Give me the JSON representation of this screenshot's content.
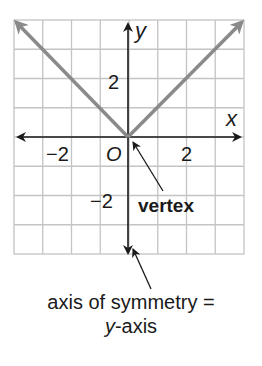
{
  "diagram": {
    "grid": {
      "x_min": -4,
      "x_max": 4,
      "y_min": -4,
      "y_max": 4,
      "cell": 1
    },
    "axes": {
      "x_label": "x",
      "y_label": "y",
      "origin_label": "O"
    },
    "ticks": {
      "x_neg": "−2",
      "x_pos": "2",
      "y_pos": "2",
      "y_neg": "−2"
    },
    "function": {
      "expression": "y = |x|",
      "color": "#8a8a8a"
    },
    "annotations": {
      "vertex": "vertex",
      "axis_line1": "axis of symmetry =",
      "axis_line2_italic": "y",
      "axis_line2_rest": "-axis"
    },
    "colors": {
      "grid": "#c4c4c4",
      "axis": "#1a1a1a",
      "graph": "#8a8a8a"
    }
  }
}
